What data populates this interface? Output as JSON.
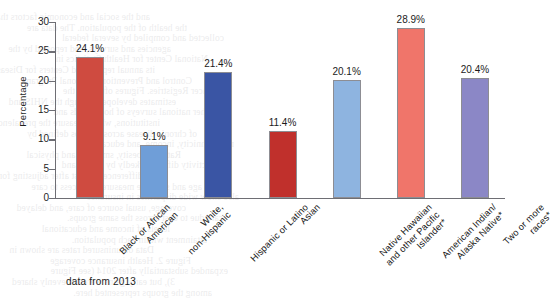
{
  "chart_data": {
    "type": "bar",
    "title": "",
    "subtitle": "",
    "xlabel": "",
    "ylabel": "Percentage",
    "ylim": [
      0,
      30
    ],
    "yticks": [
      0,
      5,
      10,
      15,
      20,
      25,
      30
    ],
    "grid": false,
    "legend": null,
    "categories": [
      "Black or African\nAmerican",
      "White,\nnon-Hispanic",
      "Hispanic or Latino",
      "Asian",
      "Native Hawaiian\nand other Pacific\nIslander*",
      "American Indian/\nAlaska Native*",
      "Two or more races*"
    ],
    "values": [
      24.1,
      9.1,
      21.4,
      11.4,
      20.1,
      28.9,
      20.4
    ],
    "data_labels": [
      "24.1%",
      "9.1%",
      "21.4%",
      "11.4%",
      "20.1%",
      "28.9%",
      "20.4%"
    ],
    "bar_colors": [
      "#cf4b40",
      "#6f9ed8",
      "#3a55a4",
      "#c0302c",
      "#8eb4e0",
      "#f0756a",
      "#8b87c6"
    ],
    "bar_border_color": "#8d8d93",
    "axis_color": "#6e6e74",
    "annotation": "data from 2013"
  },
  "caption": {
    "text": "data from 2013"
  },
  "axis": {
    "y_title": "Percentage",
    "tick_labels": [
      "30",
      "25",
      "20",
      "15",
      "10",
      "5",
      "0"
    ]
  },
  "background_text": {
    "lines": [
      "and the social and economic factors that",
      "the health of the population. The data are",
      "collected and compiled by several federal",
      "agencies and surveys, and reported by the",
      "National Center for Health Statistics in",
      "its annual reports and Centers for Disease",
      "Control and Prevention's National Program",
      "of Cancer Registries. Figures often use the",
      "estimates developed through the NHIS and",
      "other national surveys of households and",
      "institutions, which measure the prevalence",
      "of chronic disease across groups defined by",
      "race, ethnicity, income, and education.",
      "Rates of obesity, smoking, and physical",
      "inactivity differ markedly by group, and",
      "these differences persist after adjusting for",
      "age and sex. The measures of access to care",
      "also show wide disparities in insurance",
      "coverage, usual source of care, and delayed",
      "care due to cost across the same groups.",
      "levels of income and educational",
      "attainment within each population.",
      "Data on uninsured rates are shown in",
      "Figure 2. Health insurance coverage",
      "expanded substantially after 2014 (see Figure",
      "3), but early gains were not evenly shared",
      "among the groups represented here."
    ]
  }
}
